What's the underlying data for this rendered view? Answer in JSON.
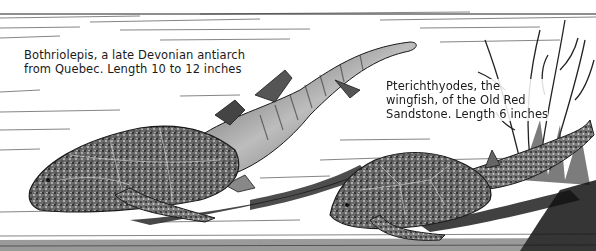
{
  "illustration": {
    "style": "black and white pen-and-ink illustration",
    "colors": {
      "ink": "#1a1a1a",
      "paper": "#ffffff",
      "shadow": "#2a2a2a"
    },
    "figures": [
      {
        "name": "Bothriolepis",
        "caption_lines": [
          "Bothriolepis, a late Devonian antiarch",
          "from Quebec. Length 10 to 12 inches"
        ]
      },
      {
        "name": "Pterichthyodes",
        "caption_lines": [
          "Pterichthyodes, the",
          "wingfish, of the Old Red",
          "Sandstone. Length 6 inches"
        ]
      }
    ]
  }
}
